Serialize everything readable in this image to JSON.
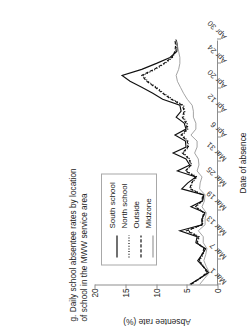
{
  "figure": {
    "title": "g. Daily school absentee rates by location\n    of school in the MWW service area",
    "legend_title": "",
    "xlabel": "Date of absence",
    "ylabel": "Absentee rate (%)"
  },
  "colors": {
    "axis": "#8d8d8d",
    "south_school": "#111111",
    "north_school": "#111111",
    "outside": "#111111",
    "midzone": "#9a9a9a",
    "legend_border": "#a8a8a8",
    "text": "#1a1a1a"
  },
  "legend": {
    "items": [
      {
        "label": "South school",
        "style": "solid",
        "color": "#111111"
      },
      {
        "label": "North school",
        "style": "dotted",
        "color": "#111111"
      },
      {
        "label": "Outside",
        "style": "dashed",
        "color": "#111111"
      },
      {
        "label": "Midzone",
        "style": "solid",
        "color": "#9a9a9a"
      }
    ]
  },
  "chart_data": {
    "type": "line",
    "title": "g. Daily school absentee rates by location of school in the MWW service area",
    "xlabel": "Date of absence",
    "ylabel": "Absentee rate (%)",
    "ylim": [
      0,
      20
    ],
    "yticks": [
      0,
      5,
      10,
      15,
      20
    ],
    "grid": false,
    "legend_position": "top-left",
    "xticks": [
      "Mar 1",
      "Mar 7",
      "Mar 13",
      "Mar 19",
      "Mar 25",
      "Mar 31",
      "Apr 6",
      "Apr 12",
      "Apr 20",
      "Apr 24",
      "Apr 30"
    ],
    "xtick_index": [
      0,
      6,
      12,
      18,
      24,
      30,
      36,
      42,
      48,
      54,
      60
    ],
    "x": [
      0,
      1,
      2,
      3,
      4,
      5,
      6,
      7,
      8,
      9,
      10,
      11,
      12,
      13,
      14,
      15,
      16,
      17,
      18,
      19,
      20,
      21,
      22,
      23,
      24,
      25,
      26,
      27,
      28,
      29,
      30,
      31,
      32,
      33,
      34,
      35,
      36,
      37,
      38,
      39,
      40,
      41
    ],
    "series": [
      {
        "name": "South school",
        "style": "solid",
        "color": "#111111",
        "values": [
          4.6,
          3.0,
          1.5,
          2.4,
          3.3,
          2.6,
          2.0,
          3.6,
          3.4,
          6.2,
          2.6,
          2.6,
          2.1,
          4.4,
          2.5,
          2.3,
          5.9,
          4.9,
          3.6,
          6.6,
          4.6,
          5.2,
          7.3,
          5.2,
          5.3,
          7.0,
          5.2,
          5.5,
          6.8,
          6.0,
          6.2,
          9.0,
          10.6,
          12.4,
          14.3,
          15.6,
          12.4,
          10.0,
          7.8,
          6.7,
          6.6,
          6.8
        ]
      },
      {
        "name": "North school",
        "style": "dotted",
        "color": "#111111",
        "values": [
          4.4,
          2.9,
          1.6,
          2.3,
          3.0,
          2.4,
          2.2,
          3.4,
          3.0,
          4.9,
          2.5,
          2.5,
          2.2,
          3.6,
          2.5,
          2.4,
          4.4,
          4.2,
          3.4,
          5.2,
          4.3,
          4.6,
          5.6,
          4.8,
          4.9,
          5.8,
          4.9,
          5.0,
          5.6,
          5.4,
          5.6,
          7.4,
          8.8,
          10.0,
          11.4,
          12.2,
          10.2,
          8.6,
          7.4,
          6.9,
          6.8,
          6.9
        ]
      },
      {
        "name": "Outside",
        "style": "dashed",
        "color": "#111111",
        "values": [
          4.4,
          3.0,
          1.8,
          2.4,
          3.1,
          2.6,
          2.3,
          3.4,
          3.2,
          5.1,
          2.6,
          2.6,
          2.3,
          3.7,
          2.6,
          2.5,
          4.6,
          4.3,
          3.6,
          5.3,
          4.4,
          4.7,
          5.8,
          4.9,
          5.0,
          6.0,
          5.0,
          5.2,
          5.8,
          5.5,
          5.8,
          7.6,
          9.0,
          10.2,
          11.6,
          12.4,
          10.4,
          8.8,
          7.5,
          7.0,
          6.9,
          7.0
        ]
      },
      {
        "name": "Midzone",
        "style": "solid",
        "color": "#9a9a9a",
        "values": [
          3.0,
          2.2,
          1.4,
          1.9,
          2.3,
          2.0,
          1.8,
          2.4,
          2.4,
          3.2,
          2.1,
          2.1,
          1.9,
          2.6,
          2.2,
          2.1,
          3.0,
          2.9,
          2.6,
          3.4,
          3.1,
          3.2,
          3.8,
          3.4,
          3.4,
          4.4,
          3.6,
          3.6,
          4.0,
          4.0,
          4.2,
          5.0,
          5.6,
          6.1,
          6.6,
          6.8,
          6.4,
          6.2,
          6.2,
          6.4,
          6.6,
          6.9
        ]
      }
    ]
  }
}
